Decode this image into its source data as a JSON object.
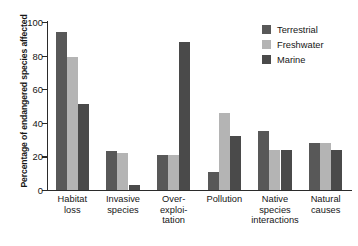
{
  "chart_data": {
    "type": "bar",
    "title": "",
    "xlabel": "",
    "ylabel": "Percentage of endangered species affected",
    "ylim": [
      0,
      100
    ],
    "yticks": [
      0,
      20,
      40,
      60,
      80,
      100
    ],
    "grid": false,
    "legend_position": "top-right",
    "categories": [
      "Habitat loss",
      "Invasive species",
      "Over-exploitation",
      "Pollution",
      "Native species interactions",
      "Natural causes"
    ],
    "category_label_lines": [
      [
        "Habitat",
        "loss"
      ],
      [
        "Invasive",
        "species"
      ],
      [
        "Over-",
        "exploi-",
        "tation"
      ],
      [
        "Pollution"
      ],
      [
        "Native",
        "species",
        "interactions"
      ],
      [
        "Natural",
        "causes"
      ]
    ],
    "series": [
      {
        "name": "Terrestrial",
        "color": "#585858",
        "values": [
          94,
          23,
          21,
          11,
          35,
          28
        ]
      },
      {
        "name": "Freshwater",
        "color": "#b4b4b4",
        "values": [
          79,
          22,
          21,
          46,
          24,
          28
        ]
      },
      {
        "name": "Marine",
        "color": "#4a4a4a",
        "values": [
          51,
          3,
          88,
          32,
          24,
          24
        ]
      }
    ]
  },
  "axis": {
    "y_tick_labels": [
      "0",
      "20",
      "40",
      "60",
      "80",
      "100"
    ]
  },
  "legend": {
    "items": [
      {
        "label": "Terrestrial",
        "color": "#585858"
      },
      {
        "label": "Freshwater",
        "color": "#b4b4b4"
      },
      {
        "label": "Marine",
        "color": "#4a4a4a"
      }
    ]
  }
}
